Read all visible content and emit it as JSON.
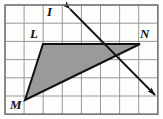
{
  "figure": {
    "kind": "geometry-diagram",
    "background_color": "#fdfdfc",
    "grid": {
      "columns": 8,
      "rows": 6,
      "x0": 5,
      "y0": 5,
      "cell_width": 19.1,
      "cell_height": 18.2,
      "line_color": "#8d8d8d",
      "border_color": "#6f6f6f",
      "line_width": 0.9
    },
    "labels": [
      {
        "id": "label-I",
        "text": "I",
        "x": 47,
        "y": 5,
        "size": 13
      },
      {
        "id": "label-L",
        "text": "L",
        "x": 30,
        "y": 27,
        "size": 13
      },
      {
        "id": "label-N",
        "text": "N",
        "x": 140,
        "y": 27,
        "size": 13
      },
      {
        "id": "label-M",
        "text": "M",
        "x": 10,
        "y": 98,
        "size": 13
      }
    ],
    "quadrilateral": {
      "name": "LMN-shaded-region",
      "fill_color": "#9a9a9a",
      "stroke_color": "#111111",
      "stroke_width": 2.0,
      "points": "43,44 140,44 25,100"
    },
    "polyline_top": {
      "name": "top-edge-LN",
      "points": "43,44 140,44"
    },
    "arrow_line": {
      "name": "double-headed-arrow-through-I",
      "stroke_color": "#111111",
      "stroke_width": 1.8,
      "start_x": 70,
      "start_y": 9,
      "end_x": 155,
      "end_y": 95,
      "head_length": 9,
      "head_width": 6
    }
  }
}
